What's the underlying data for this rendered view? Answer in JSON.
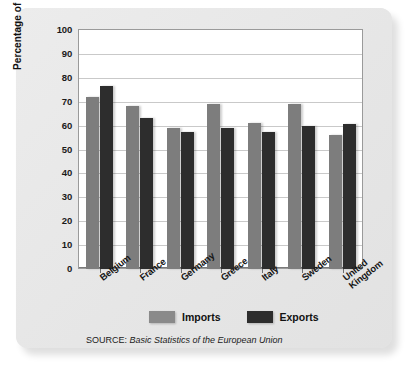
{
  "chart_data": {
    "type": "bar",
    "title": "",
    "xlabel": "",
    "ylabel": "Percentage of Total Trade",
    "ylim": [
      0,
      100
    ],
    "ytick_step": 10,
    "yticks": [
      "100",
      "90",
      "80",
      "70",
      "60",
      "50",
      "40",
      "30",
      "20",
      "10",
      "0"
    ],
    "grid": true,
    "legend_position": "bottom",
    "categories": [
      "Belgium",
      "France",
      "Germany",
      "Greece",
      "Italy",
      "Sweden",
      "United Kingdom"
    ],
    "category_lines": [
      [
        "Belgium"
      ],
      [
        "France"
      ],
      [
        "Germany"
      ],
      [
        "Greece"
      ],
      [
        "Italy"
      ],
      [
        "Sweden"
      ],
      [
        "United",
        "Kingdom"
      ]
    ],
    "series": [
      {
        "name": "Imports",
        "color": "#7d7d7d",
        "values": [
          72,
          68,
          59,
          69,
          61,
          69,
          56
        ]
      },
      {
        "name": "Exports",
        "color": "#2d2d2d",
        "values": [
          76.5,
          63,
          57.5,
          59,
          57.5,
          60,
          60.5
        ]
      }
    ]
  },
  "legend": {
    "imports_label": "Imports",
    "exports_label": "Exports"
  },
  "source": {
    "prefix": "SOURCE: ",
    "title": "Basic Statistics of the European Union"
  },
  "colors": {
    "imports": "#7d7d7d",
    "exports": "#2d2d2d",
    "panel": "#e8e8e8",
    "plot_background": "#ffffff",
    "gridline": "#c9c9c9"
  }
}
